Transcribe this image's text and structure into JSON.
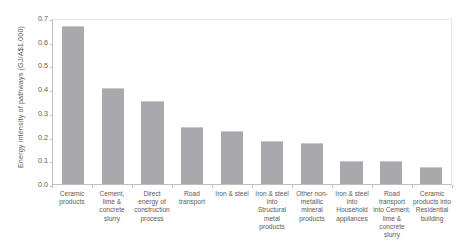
{
  "chart_data": {
    "type": "bar",
    "title": "",
    "subtitle": "",
    "xlabel": "",
    "ylabel": "Energy intensity of pathways (GJ/A$1,000)",
    "ylim": [
      0.0,
      0.7
    ],
    "ytick_labels": [
      "0.7",
      "0.6",
      "0.5",
      "0.4",
      "0.3",
      "0.2",
      "0.1",
      "0.0"
    ],
    "ytick_values": [
      0.7,
      0.6,
      0.5,
      0.4,
      0.3,
      0.2,
      0.1,
      0.0
    ],
    "grid": false,
    "legend": false,
    "legend_position": "none",
    "bar_color": "#a9a9ad",
    "categories": [
      "Ceramic products",
      "Cement, lime & concrete slurry",
      "Direct energy of construction process",
      "Road transport",
      "Iron & steel",
      "Iron & steel into Structural metal products",
      "Other non-metallic mineral products",
      "Iron & steel into Household appliances",
      "Road transport into Cement, lime & concrete slurry",
      "Ceramic products into Residential building"
    ],
    "values": [
      0.665,
      0.405,
      0.352,
      0.241,
      0.222,
      0.182,
      0.172,
      0.099,
      0.098,
      0.073
    ]
  },
  "axis": {
    "y_title": "Energy intensity of pathways (GJ/A$1,000)"
  }
}
